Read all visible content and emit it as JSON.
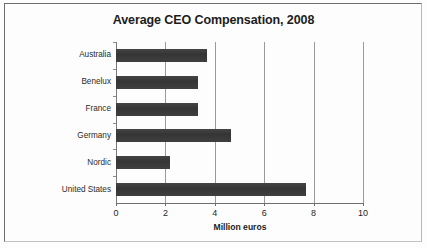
{
  "chart_data": {
    "type": "bar",
    "orientation": "horizontal",
    "title": "Average CEO Compensation, 2008",
    "xlabel": "Million euros",
    "ylabel": "",
    "categories": [
      "Australia",
      "Benelux",
      "France",
      "Germany",
      "Nordic",
      "United States"
    ],
    "values": [
      3.7,
      3.3,
      3.3,
      4.65,
      2.2,
      7.7
    ],
    "xlim": [
      0,
      10
    ],
    "xticks": [
      0,
      2,
      4,
      6,
      8,
      10
    ],
    "xtick_labels": [
      "0",
      "2",
      "4",
      "6",
      "8",
      "10"
    ],
    "grid": true,
    "grid_axis": "x",
    "legend": false,
    "series": [
      {
        "name": "Average CEO Compensation",
        "values": [
          3.7,
          3.3,
          3.3,
          4.65,
          2.2,
          7.7
        ]
      }
    ]
  },
  "colors": {
    "bar": "#3b3b3b",
    "gridline": "#9a9a9a",
    "axis": "#6f6f6f",
    "text": "#1c1c1c",
    "background": "#fdfdfd",
    "page_border": "#6e6e6e"
  }
}
